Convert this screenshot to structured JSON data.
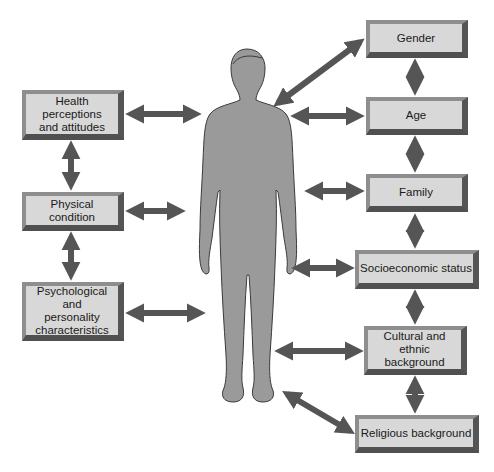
{
  "diagram": {
    "type": "influence diagram",
    "center": {
      "label": "Person (human figure silhouette)",
      "color": "#9a9a9a"
    },
    "left_factors": [
      {
        "id": "health",
        "label": "Health perceptions\nand attitudes"
      },
      {
        "id": "physical",
        "label": "Physical condition"
      },
      {
        "id": "psych",
        "label": "Psychological and\npersonality\ncharacteristics"
      }
    ],
    "right_factors": [
      {
        "id": "gender",
        "label": "Gender"
      },
      {
        "id": "age",
        "label": "Age"
      },
      {
        "id": "family",
        "label": "Family"
      },
      {
        "id": "ses",
        "label": "Socioeconomic status"
      },
      {
        "id": "culture",
        "label": "Cultural and\nethnic background"
      },
      {
        "id": "religion",
        "label": "Religious background"
      }
    ],
    "connections": "All factors connect to the person with double-headed arrows; adjacent factors in each column are linked by vertical double-headed arrows",
    "colors": {
      "arrow": "#555555",
      "box_face": "#d8d8d8",
      "box_bevel_light": "#8e8e8e",
      "box_bevel_dark": "#505050",
      "figure": "#9a9a9a"
    }
  }
}
